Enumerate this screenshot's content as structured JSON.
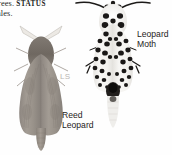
{
  "page": {
    "width": 172,
    "height": 155,
    "background_color": "#fefefe"
  },
  "body_text": {
    "line_1_prefix": "rees.",
    "line_1_smallcaps": "STATUS",
    "line_2": "ales."
  },
  "captions": {
    "leopard_moth": "Leopard\nMoth",
    "leopard_moth_line_1": "Leopard",
    "leopard_moth_line_2": "Moth",
    "reed_leopard_line_1": "Reed",
    "reed_leopard_line_2": "Leopard",
    "scale_note": "LS"
  },
  "figures": [
    {
      "id": "reed-leopard",
      "name": "Reed Leopard moth specimen",
      "caption": "Reed Leopard",
      "colors": {
        "wing": "#9c958c",
        "wing_shade": "#8a8279",
        "thorax": "#7a736b",
        "antenna": "#e8e5e0",
        "abdomen": "#8f887f"
      }
    },
    {
      "id": "leopard-moth",
      "name": "Leopard Moth specimen",
      "caption": "Leopard Moth",
      "colors": {
        "wing": "#f2f1ee",
        "spot": "#1a1817",
        "thorax": "#f6f5f3",
        "antenna": "#1a1817",
        "abdomen": "#2b2826"
      }
    }
  ],
  "colors": {
    "page_background": "#fefefe",
    "text": "#231f1d",
    "caption_text": "#1e1c1b",
    "scale_note_text": "#b9b6b2"
  }
}
